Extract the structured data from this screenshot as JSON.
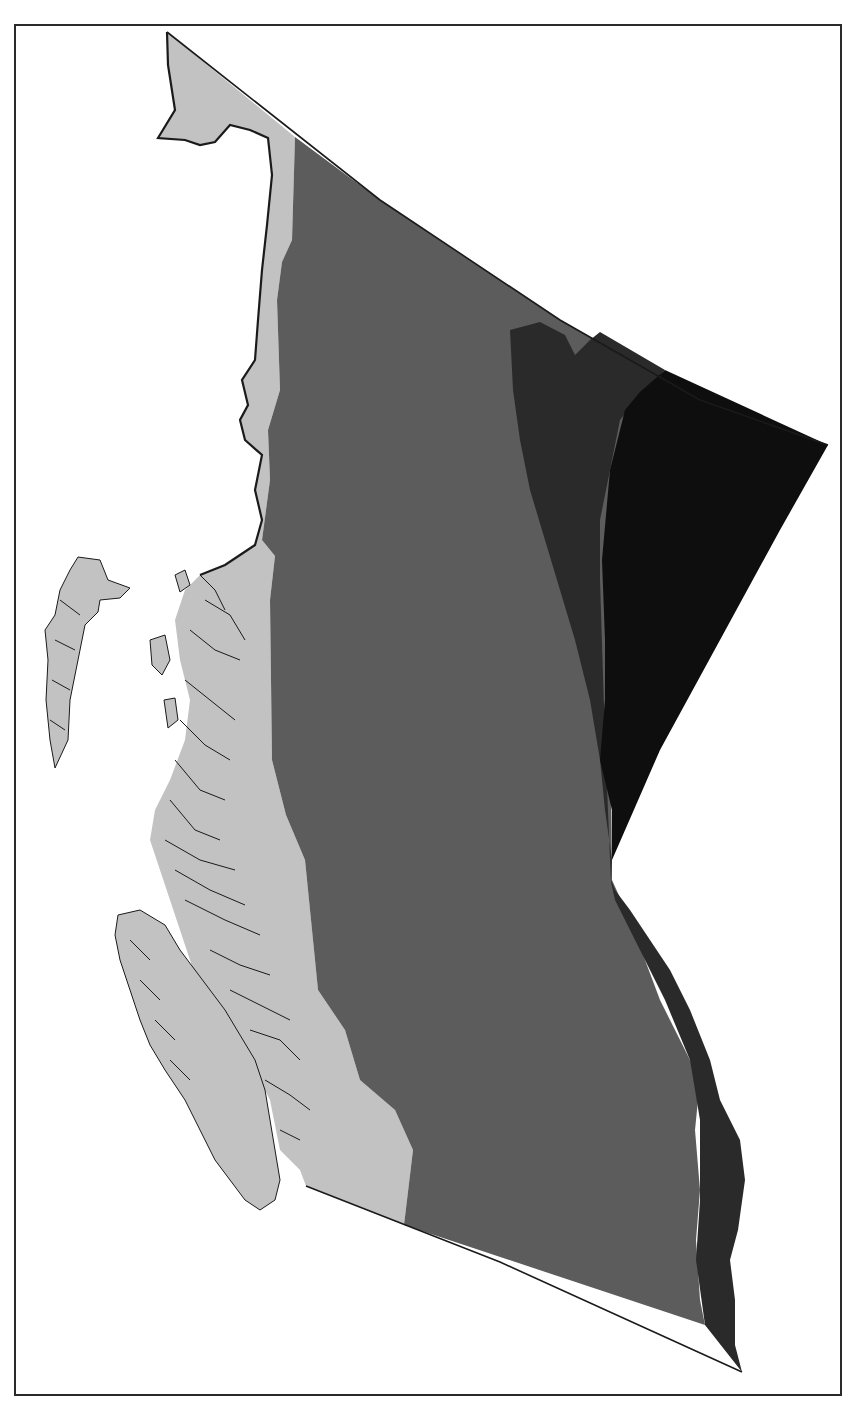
{
  "map": {
    "subject": "British Columbia",
    "style": "grayscale choropleth, no legend, no labels",
    "frame": {
      "stroke": "#2a2a2a"
    },
    "background": "#ffffff",
    "zones": [
      {
        "id": "zone-1-coastal",
        "fill": "#c2c2c2",
        "path": "M167,32 L295,137 L292,240 L282,262 L277,300 L280,390 L268,430 L270,480 L262,540 L275,556 L270,600 L272,760 L286,815 L305,860 L318,990 L345,1030 L360,1080 L395,1110 L413,1150 L404,1225 L306,1186 L300,1170 L280,1150 L270,1100 L250,1060 L230,1040 L210,1020 L200,990 L190,960 L180,930 L170,900 L160,870 L150,840 L155,810 L170,780 L185,740 L190,700 L180,660 L175,620 L185,590 L200,575 L225,565 L240,555 L255,545 L262,520 L255,490 L262,455 L245,440 L240,420 L248,405 L242,380 L255,360 L258,320 L262,270 L267,225 L272,175 L268,138 L250,130 L230,125 L215,142 L200,145 L185,140 L158,138 L175,110 L168,65 Z"
      },
      {
        "id": "zone-2-central",
        "fill": "#5c5c5c",
        "path": "M295,137 L380,200 L470,260 L560,320 L650,370 L700,400 L610,640 L612,880 L630,920 L660,1000 L700,1080 L695,1130 L700,1190 L696,1240 L700,1300 L705,1325 L404,1225 L413,1150 L395,1110 L360,1080 L345,1030 L318,990 L305,860 L286,815 L272,760 L270,600 L275,556 L262,540 L270,480 L268,430 L280,390 L277,300 L282,262 L292,240 Z"
      },
      {
        "id": "zone-3-interior",
        "fill": "#2a2a2a",
        "path": "M510,330 L540,322 L565,335 L575,355 L590,340 L600,332 L665,370 L640,395 L620,420 L600,520 L600,580 L605,740 L611,882 L615,900 L640,950 L665,1000 L690,1060 L700,1120 L700,1200 L696,1260 L705,1325 L742,1372 L735,1345 L735,1300 L730,1260 L738,1230 L745,1180 L740,1140 L720,1100 L710,1060 L690,1010 L670,970 L650,940 L630,910 L615,890 L611,880 L612,860 L605,810 L600,760 L590,700 L575,640 L560,590 L545,540 L530,490 L520,440 L513,390 Z"
      },
      {
        "id": "zone-4-northeast",
        "fill": "#0e0e0e",
        "path": "M665,370 L828,445 L780,530 L720,640 L660,750 L612,860 L612,810 L600,760 L605,700 L605,640 L602,560 L610,470 L625,410 L640,392 Z"
      }
    ],
    "islands": [
      {
        "id": "haida-gwaii",
        "fill": "#c2c2c2",
        "path": "M78,557 L100,560 L108,580 L130,588 L120,598 L100,600 L98,612 L85,625 L80,650 L70,700 L68,740 L55,768 L50,740 L46,700 L48,660 L45,630 L55,615 L60,590 L70,570 Z"
      },
      {
        "id": "vancouver-island",
        "fill": "#c2c2c2",
        "path": "M118,915 L140,910 L165,925 L180,950 L195,970 L210,990 L225,1010 L240,1035 L255,1060 L265,1090 L270,1120 L275,1150 L280,1180 L275,1200 L260,1210 L245,1200 L230,1180 L215,1160 L200,1130 L185,1100 L165,1070 L150,1045 L140,1020 L130,990 L120,960 L115,935 Z"
      },
      {
        "id": "coastal-islet-1",
        "fill": "#c2c2c2",
        "path": "M175,575 L185,570 L190,585 L180,592 Z"
      },
      {
        "id": "coastal-islet-2",
        "fill": "#c2c2c2",
        "path": "M150,640 L165,635 L170,660 L162,675 L152,665 Z"
      },
      {
        "id": "coastal-islet-3",
        "fill": "#c2c2c2",
        "path": "M164,700 L175,698 L178,720 L168,728 Z"
      }
    ],
    "coastline_stroke": "#1a1a1a",
    "boundary_stroke": "#1a1a1a"
  }
}
